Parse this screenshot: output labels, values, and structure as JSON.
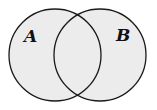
{
  "diagram": {
    "type": "venn",
    "sets": [
      {
        "label": "A",
        "cx": 55,
        "cy": 55,
        "r": 46
      },
      {
        "label": "B",
        "cx": 100,
        "cy": 55,
        "r": 46
      }
    ],
    "fill_color": "#ececec",
    "stroke_color": "#1a1a1a"
  }
}
